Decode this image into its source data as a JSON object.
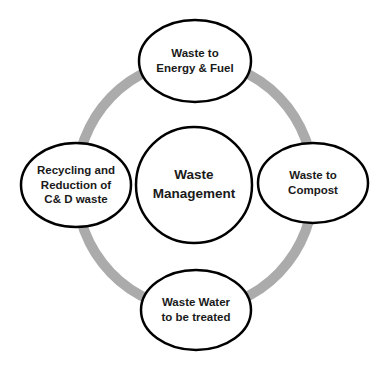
{
  "diagram": {
    "type": "cycle",
    "ring_color": "#ababab",
    "outline_color": "#000000",
    "center": {
      "lines": [
        "Waste",
        "Management"
      ]
    },
    "nodes": [
      {
        "position": "top",
        "lines": [
          "Waste to",
          "Energy & Fuel"
        ]
      },
      {
        "position": "right",
        "lines": [
          "Waste to",
          "Compost"
        ]
      },
      {
        "position": "bottom",
        "lines": [
          "Waste Water",
          "to be treated"
        ]
      },
      {
        "position": "left",
        "lines": [
          "Recycling and",
          "Reduction of",
          "C& D waste"
        ]
      }
    ]
  }
}
